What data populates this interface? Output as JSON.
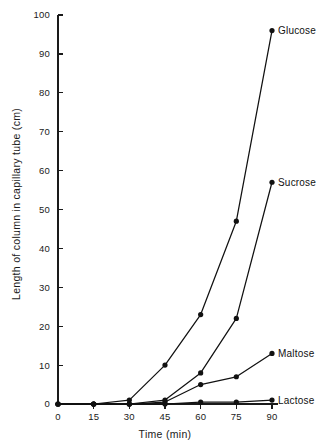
{
  "chart_data": {
    "type": "line",
    "title": "",
    "xlabel": "Time (min)",
    "ylabel": "Length of column in capillary tube (cm)",
    "xlim": [
      0,
      90
    ],
    "ylim": [
      0,
      100
    ],
    "xticks": [
      0,
      15,
      30,
      45,
      60,
      75,
      90
    ],
    "xtick_labels": [
      "0",
      "15",
      "30",
      "45",
      "60",
      "75",
      "90"
    ],
    "yticks": [
      0,
      10,
      20,
      30,
      40,
      50,
      60,
      70,
      80,
      90,
      100
    ],
    "ytick_labels": [
      "0",
      "10",
      "20",
      "30",
      "40",
      "50",
      "60",
      "70",
      "80",
      "90",
      "100"
    ],
    "grid": false,
    "legend_position": "inline-end-labels",
    "x": [
      0,
      15,
      30,
      45,
      60,
      75,
      90
    ],
    "series": [
      {
        "name": "Glucose",
        "label": "Glucose",
        "color": "#111111",
        "values": [
          0,
          0,
          1,
          10,
          23,
          47,
          96
        ]
      },
      {
        "name": "Sucrose",
        "label": "Sucrose",
        "color": "#111111",
        "values": [
          0,
          0,
          0,
          1,
          8,
          22,
          57
        ]
      },
      {
        "name": "Maltose",
        "label": "Maltose",
        "color": "#111111",
        "values": [
          0,
          0,
          0,
          0.5,
          5,
          7,
          13
        ]
      },
      {
        "name": "Lactose",
        "label": "Lactose",
        "color": "#111111",
        "values": [
          0,
          0,
          0,
          0,
          0.5,
          0.5,
          1
        ]
      }
    ],
    "annotations": []
  },
  "figure": {
    "background_color": "#ffffff",
    "axis_color": "#1a1a1a"
  }
}
